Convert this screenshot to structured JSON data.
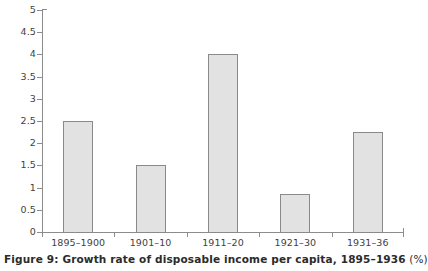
{
  "chart_data": {
    "type": "bar",
    "title": "",
    "caption": "Figure 9: Growth rate of disposable income per capita, 1895–1936",
    "caption_unit": "(%)",
    "figure_number": "Figure 9",
    "categories": [
      "1895–1900",
      "1901–10",
      "1911–20",
      "1921–30",
      "1931–36"
    ],
    "values": [
      2.5,
      1.5,
      4.0,
      0.85,
      2.25
    ],
    "xlabel": "",
    "ylabel": "",
    "ylim": [
      0,
      5
    ],
    "ytick_labels": [
      "0",
      "0.5",
      "1",
      "1.5",
      "2",
      "2.5",
      "3",
      "3.5",
      "4",
      "4.5",
      "5"
    ],
    "ytick_values": [
      0,
      0.5,
      1,
      1.5,
      2,
      2.5,
      3,
      3.5,
      4,
      4.5,
      5
    ],
    "grid": false,
    "legend": false,
    "series": [
      {
        "name": "Growth rate of disposable income per capita",
        "values": [
          2.5,
          1.5,
          4.0,
          0.85,
          2.25
        ]
      }
    ],
    "colors": {
      "bar_fill": "#e2e2e2",
      "bar_stroke": "#8a8a8a",
      "axis": "#8c8c8c",
      "text": "#3f3f3f",
      "caption_text": "#2b2b2b",
      "background": "#ffffff"
    }
  }
}
